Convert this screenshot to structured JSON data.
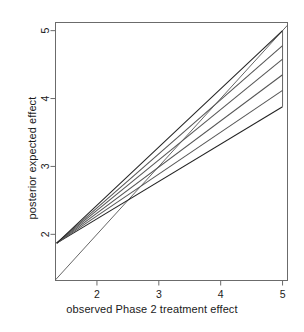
{
  "chart_data": {
    "type": "line",
    "title": "",
    "subtitle": "",
    "xlabel": "observed Phase 2 treatment effect",
    "ylabel": "posterior expected effect",
    "xlim": [
      1.33,
      5.08
    ],
    "ylim": [
      1.32,
      5.12
    ],
    "xticks": [
      2,
      3,
      4,
      5
    ],
    "xtick_labels": [
      "2",
      "3",
      "4",
      "5"
    ],
    "yticks": [
      2,
      3,
      4,
      5
    ],
    "ytick_labels": [
      "2",
      "3",
      "4",
      "5"
    ],
    "grid": false,
    "legend": null,
    "box": true,
    "annotations": [],
    "series": [
      {
        "name": "identity-line",
        "kind": "reference",
        "color": "#555555",
        "x": [
          1.33,
          5.08
        ],
        "y": [
          1.33,
          5.08
        ]
      },
      {
        "name": "shrinkage-line-1",
        "kind": "fan",
        "color": "#222222",
        "x": [
          1.35,
          5.0
        ],
        "y": [
          1.87,
          3.88
        ]
      },
      {
        "name": "shrinkage-line-2",
        "kind": "fan",
        "color": "#555555",
        "x": [
          1.35,
          5.0
        ],
        "y": [
          1.87,
          4.12
        ]
      },
      {
        "name": "shrinkage-line-3",
        "kind": "fan",
        "color": "#555555",
        "x": [
          1.35,
          5.0
        ],
        "y": [
          1.87,
          4.35
        ]
      },
      {
        "name": "shrinkage-line-4",
        "kind": "fan",
        "color": "#555555",
        "x": [
          1.35,
          5.0
        ],
        "y": [
          1.87,
          4.58
        ]
      },
      {
        "name": "shrinkage-line-5",
        "kind": "fan",
        "color": "#555555",
        "x": [
          1.35,
          5.0
        ],
        "y": [
          1.87,
          4.78
        ]
      },
      {
        "name": "shrinkage-line-6",
        "kind": "fan",
        "color": "#222222",
        "x": [
          1.35,
          5.0
        ],
        "y": [
          1.87,
          5.0
        ]
      },
      {
        "name": "right-edge-connector",
        "kind": "connector",
        "color": "#555555",
        "x": [
          5.0,
          5.0
        ],
        "y": [
          3.88,
          5.0
        ]
      }
    ]
  },
  "axes": {
    "x_title": "observed Phase 2 treatment effect",
    "y_title": "posterior expected effect"
  },
  "ticks": {
    "x": [
      "2",
      "3",
      "4",
      "5"
    ],
    "y": [
      "2",
      "3",
      "4",
      "5"
    ]
  },
  "colors": {
    "background": "#ffffff",
    "axis": "#6b6b6b",
    "text": "#1a1a1a",
    "line_dark": "#222222",
    "line_mid": "#555555"
  }
}
